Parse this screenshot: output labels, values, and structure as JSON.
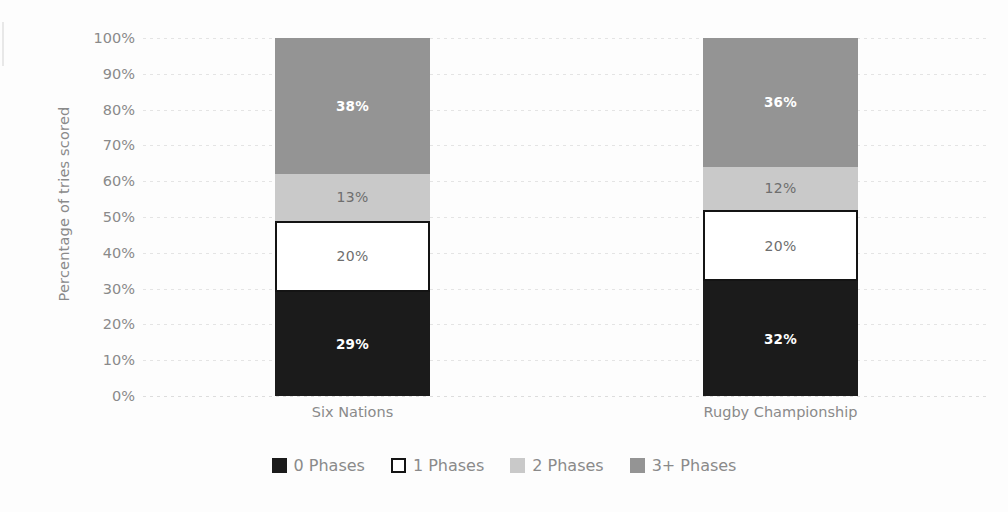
{
  "chart_data": {
    "type": "bar",
    "subtype": "100% stacked bar",
    "title": "",
    "xlabel": "",
    "ylabel": "Percentage of tries scored",
    "categories": [
      "Six Nations",
      "Rugby Championship"
    ],
    "series": [
      {
        "name": "0 Phases",
        "values": [
          29,
          20
        ],
        "color": "#1b1b1b",
        "label_color": "#ffffff"
      },
      {
        "name": "1 Phases",
        "values": [
          20,
          20
        ],
        "color": "#ffffff",
        "label_color": "#6e6e6e"
      },
      {
        "name": "2 Phases",
        "values": [
          13,
          12
        ],
        "color": "#c9c9c9",
        "label_color": "#6e6e6e"
      },
      {
        "name": "3+ Phases",
        "values": [
          38,
          36
        ],
        "color": "#949494",
        "label_color": "#ffffff"
      }
    ],
    "bars": [
      {
        "category": "Six Nations",
        "segments": [
          {
            "name": "0 Phases",
            "value": 29,
            "data_label": "29%"
          },
          {
            "name": "1 Phases",
            "value": 20,
            "data_label": "20%"
          },
          {
            "name": "2 Phases",
            "value": 13,
            "data_label": "13%"
          },
          {
            "name": "3+ Phases",
            "value": 38,
            "data_label": "38%"
          }
        ]
      },
      {
        "category": "Rugby Championship",
        "segments": [
          {
            "name": "0 Phases",
            "value": 32,
            "data_label": "32%"
          },
          {
            "name": "1 Phases",
            "value": 20,
            "data_label": "20%"
          },
          {
            "name": "2 Phases",
            "value": 12,
            "data_label": "12%"
          },
          {
            "name": "3+ Phases",
            "value": 36,
            "data_label": "36%"
          }
        ]
      }
    ],
    "ylim": [
      0,
      100
    ],
    "ytick_values": [
      0,
      10,
      20,
      30,
      40,
      50,
      60,
      70,
      80,
      90,
      100
    ],
    "ytick_labels": [
      "0%",
      "10%",
      "20%",
      "30%",
      "40%",
      "50%",
      "60%",
      "70%",
      "80%",
      "90%",
      "100%"
    ],
    "grid": true,
    "grid_style": "dotted-horizontal",
    "legend_position": "bottom",
    "legend": [
      {
        "label": "0 Phases",
        "swatch": "s0"
      },
      {
        "label": "1 Phases",
        "swatch": "s1"
      },
      {
        "label": "2 Phases",
        "swatch": "s2"
      },
      {
        "label": "3+ Phases",
        "swatch": "s3"
      }
    ]
  }
}
